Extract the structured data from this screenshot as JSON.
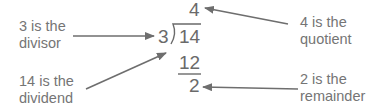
{
  "diagram": {
    "problem": {
      "divisor": "3",
      "dividend": "14",
      "quotient": "4",
      "product": "12",
      "remainder": "2"
    },
    "labels": {
      "divisor": {
        "line1": "3 is the",
        "line2": "divisor"
      },
      "dividend": {
        "line1": "14 is the",
        "line2": "dividend"
      },
      "quotient": {
        "line1": "4 is the",
        "line2": "quotient"
      },
      "remainder": {
        "line1": "2 is the",
        "line2": "remainder"
      }
    },
    "colors": {
      "text": "#757575",
      "arrow": "#6e6e6e",
      "background": "#ffffff"
    }
  }
}
